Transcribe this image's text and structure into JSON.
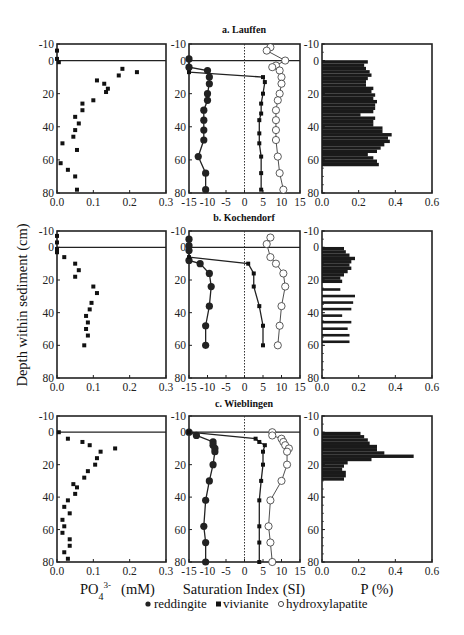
{
  "figure": {
    "y_axis_label": "Depth within sediment (cm)",
    "x_axis_labels": {
      "left": "PO",
      "left_sub": "4",
      "left_sup": "3-",
      "left_unit": "(mM)",
      "middle": "Saturation Index (SI)",
      "right": "P (%)"
    },
    "legend": [
      {
        "marker": "filled-circle",
        "label": "reddingite"
      },
      {
        "marker": "filled-square",
        "label": "vivianite"
      },
      {
        "marker": "open-circle",
        "label": "hydroxylapatite"
      }
    ],
    "panels": [
      {
        "id": "a",
        "title": "a. Lauffen"
      },
      {
        "id": "b",
        "title": "b. Kochendorf"
      },
      {
        "id": "c",
        "title": "c. Wieblingen"
      }
    ],
    "ticks": {
      "y": [
        "-10",
        "0",
        "20",
        "40",
        "60",
        "80"
      ],
      "left_x": [
        "0.0",
        "0.1",
        "0.2",
        "0.3"
      ],
      "middle_x": [
        "-15",
        "-10",
        "-5",
        "0",
        "5",
        "10",
        "15"
      ],
      "right_x": [
        "0.0",
        "0.2",
        "0.4",
        "0.6"
      ]
    }
  },
  "chart_data": [
    {
      "panel": "a. Lauffen",
      "type": "scatter",
      "title": "a. Lauffen",
      "xlabel": "PO4 3- (mM)",
      "ylabel": "Depth within sediment (cm)",
      "xlim": [
        0.0,
        0.3
      ],
      "ylim": [
        80,
        -10
      ],
      "series": [
        {
          "name": "PO4",
          "points": [
            [
              0.0,
              -6
            ],
            [
              0.0,
              -1
            ],
            [
              0.005,
              1
            ],
            [
              0.18,
              5
            ],
            [
              0.22,
              7
            ],
            [
              0.17,
              9
            ],
            [
              0.11,
              12
            ],
            [
              0.13,
              14
            ],
            [
              0.14,
              17
            ],
            [
              0.135,
              19
            ],
            [
              0.1,
              24
            ],
            [
              0.07,
              26
            ],
            [
              0.07,
              30
            ],
            [
              0.05,
              34
            ],
            [
              0.06,
              38
            ],
            [
              0.05,
              42
            ],
            [
              0.045,
              46
            ],
            [
              0.015,
              50
            ],
            [
              0.055,
              54
            ],
            [
              0.01,
              62
            ],
            [
              0.03,
              66
            ],
            [
              0.05,
              70
            ],
            [
              0.055,
              78
            ]
          ]
        }
      ]
    },
    {
      "panel": "a. Lauffen",
      "type": "line",
      "xlabel": "Saturation Index (SI)",
      "xlim": [
        -15,
        15
      ],
      "ylim": [
        80,
        -10
      ],
      "series": [
        {
          "name": "reddingite",
          "points": [
            [
              -15,
              -1
            ],
            [
              -15,
              4
            ],
            [
              -10,
              6
            ],
            [
              -9.5,
              10
            ],
            [
              -9.5,
              14
            ],
            [
              -10,
              20
            ],
            [
              -10,
              24
            ],
            [
              -11,
              30
            ],
            [
              -11,
              36
            ],
            [
              -11,
              42
            ],
            [
              -11,
              48
            ],
            [
              -12.5,
              58
            ],
            [
              -10.5,
              68
            ],
            [
              -10.5,
              78
            ]
          ]
        },
        {
          "name": "vivianite",
          "points": [
            [
              -15,
              7
            ],
            [
              5,
              10
            ],
            [
              5.5,
              13
            ],
            [
              5,
              20
            ],
            [
              4.5,
              26
            ],
            [
              4.5,
              32
            ],
            [
              4,
              36
            ],
            [
              4,
              44
            ],
            [
              4,
              50
            ],
            [
              4.5,
              58
            ],
            [
              4.5,
              68
            ],
            [
              4.5,
              78
            ]
          ]
        },
        {
          "name": "hydroxylapatite",
          "points": [
            [
              7,
              -8
            ],
            [
              6,
              -6
            ],
            [
              11,
              0
            ],
            [
              8.5,
              3
            ],
            [
              7.5,
              4
            ],
            [
              9.5,
              6
            ],
            [
              10,
              10
            ],
            [
              10,
              14
            ],
            [
              9.5,
              20
            ],
            [
              9,
              24
            ],
            [
              8.5,
              30
            ],
            [
              8.5,
              36
            ],
            [
              8.5,
              42
            ],
            [
              8.5,
              48
            ],
            [
              9,
              58
            ],
            [
              9.5,
              68
            ],
            [
              10.5,
              78
            ]
          ]
        }
      ]
    },
    {
      "panel": "a. Lauffen",
      "type": "bar",
      "orientation": "horizontal",
      "xlabel": "P (%)",
      "xlim": [
        0.0,
        0.6
      ],
      "ylim": [
        80,
        -10
      ],
      "depths": [
        1,
        3,
        5,
        7,
        9,
        11,
        13,
        15,
        17,
        19,
        21,
        23,
        25,
        27,
        29,
        31,
        33,
        35,
        37,
        39,
        41,
        43,
        45,
        47,
        49,
        51,
        53,
        55,
        57,
        59,
        61,
        63
      ],
      "values": [
        0.25,
        0.23,
        0.24,
        0.26,
        0.27,
        0.25,
        0.24,
        0.24,
        0.28,
        0.27,
        0.29,
        0.28,
        0.3,
        0.29,
        0.29,
        0.28,
        0.21,
        0.29,
        0.28,
        0.28,
        0.33,
        0.33,
        0.38,
        0.36,
        0.37,
        0.34,
        0.32,
        0.3,
        0.25,
        0.28,
        0.3,
        0.31
      ]
    },
    {
      "panel": "b. Kochendorf",
      "type": "scatter",
      "title": "b. Kochendorf",
      "xlabel": "PO4 3- (mM)",
      "xlim": [
        0.0,
        0.3
      ],
      "ylim": [
        80,
        -10
      ],
      "series": [
        {
          "name": "PO4",
          "points": [
            [
              0.0,
              -7
            ],
            [
              0.0,
              -3
            ],
            [
              0.0,
              1
            ],
            [
              0.0,
              3
            ],
            [
              0.02,
              6
            ],
            [
              0.05,
              10
            ],
            [
              0.06,
              14
            ],
            [
              0.05,
              18
            ],
            [
              0.1,
              24
            ],
            [
              0.11,
              28
            ],
            [
              0.095,
              34
            ],
            [
              0.09,
              38
            ],
            [
              0.08,
              42
            ],
            [
              0.085,
              46
            ],
            [
              0.08,
              50
            ],
            [
              0.085,
              54
            ],
            [
              0.075,
              60
            ]
          ]
        }
      ]
    },
    {
      "panel": "b. Kochendorf",
      "type": "line",
      "xlabel": "Saturation Index (SI)",
      "xlim": [
        -15,
        15
      ],
      "ylim": [
        80,
        -10
      ],
      "series": [
        {
          "name": "reddingite",
          "points": [
            [
              -15,
              -5
            ],
            [
              -15,
              -1
            ],
            [
              -15,
              2
            ],
            [
              -15,
              8
            ],
            [
              -12,
              10
            ],
            [
              -9.5,
              16
            ],
            [
              -9,
              24
            ],
            [
              -9.5,
              36
            ],
            [
              -10.5,
              48
            ],
            [
              -10.5,
              60
            ]
          ]
        },
        {
          "name": "vivianite",
          "points": [
            [
              -15,
              6
            ],
            [
              1,
              10
            ],
            [
              2.5,
              16
            ],
            [
              2.5,
              24
            ],
            [
              4,
              36
            ],
            [
              5,
              48
            ],
            [
              5,
              60
            ]
          ]
        },
        {
          "name": "hydroxylapatite",
          "points": [
            [
              7,
              -6
            ],
            [
              6,
              -2
            ],
            [
              7,
              6
            ],
            [
              8.5,
              10
            ],
            [
              10.5,
              16
            ],
            [
              11,
              24
            ],
            [
              10,
              36
            ],
            [
              9.5,
              48
            ],
            [
              9,
              60
            ]
          ]
        }
      ]
    },
    {
      "panel": "b. Kochendorf",
      "type": "bar",
      "orientation": "horizontal",
      "xlabel": "P (%)",
      "xlim": [
        0.0,
        0.6
      ],
      "ylim": [
        80,
        -10
      ],
      "depths": [
        1,
        3,
        5,
        7,
        9,
        11,
        13,
        15,
        17,
        19,
        21,
        26,
        30,
        34,
        38,
        42,
        46,
        50,
        54,
        58
      ],
      "values": [
        0.12,
        0.13,
        0.15,
        0.18,
        0.16,
        0.15,
        0.16,
        0.14,
        0.12,
        0.1,
        0.11,
        0.1,
        0.18,
        0.17,
        0.16,
        0.11,
        0.16,
        0.14,
        0.15,
        0.15
      ]
    },
    {
      "panel": "c. Wieblingen",
      "type": "scatter",
      "title": "c. Wieblingen",
      "xlabel": "PO4 3- (mM)",
      "xlim": [
        0.0,
        0.3
      ],
      "ylim": [
        80,
        -10
      ],
      "series": [
        {
          "name": "PO4",
          "points": [
            [
              0.005,
              0
            ],
            [
              0.03,
              4
            ],
            [
              0.07,
              6
            ],
            [
              0.09,
              8
            ],
            [
              0.16,
              10
            ],
            [
              0.12,
              12
            ],
            [
              0.11,
              16
            ],
            [
              0.105,
              20
            ],
            [
              0.085,
              24
            ],
            [
              0.075,
              28
            ],
            [
              0.045,
              32
            ],
            [
              0.055,
              34
            ],
            [
              0.05,
              38
            ],
            [
              0.03,
              42
            ],
            [
              0.02,
              46
            ],
            [
              0.035,
              50
            ],
            [
              0.015,
              54
            ],
            [
              0.02,
              58
            ],
            [
              0.015,
              62
            ],
            [
              0.035,
              66
            ],
            [
              0.035,
              70
            ],
            [
              0.02,
              74
            ],
            [
              0.03,
              78
            ]
          ]
        }
      ]
    },
    {
      "panel": "c. Wieblingen",
      "type": "line",
      "xlabel": "Saturation Index (SI)",
      "xlim": [
        -15,
        15
      ],
      "ylim": [
        80,
        -10
      ],
      "series": [
        {
          "name": "reddingite",
          "points": [
            [
              -15,
              0
            ],
            [
              -13,
              2
            ],
            [
              -8.5,
              6
            ],
            [
              -8.5,
              8
            ],
            [
              -8,
              10
            ],
            [
              -8,
              12
            ],
            [
              -8.5,
              20
            ],
            [
              -9.5,
              30
            ],
            [
              -10.5,
              42
            ],
            [
              -11,
              58
            ],
            [
              -10.5,
              68
            ],
            [
              -10.5,
              80
            ]
          ]
        },
        {
          "name": "vivianite",
          "points": [
            [
              -15,
              0
            ],
            [
              3,
              4
            ],
            [
              4,
              6
            ],
            [
              5.5,
              8
            ],
            [
              5,
              12
            ],
            [
              5,
              20
            ],
            [
              4.5,
              30
            ],
            [
              4,
              42
            ],
            [
              4,
              58
            ],
            [
              4,
              68
            ],
            [
              4,
              80
            ]
          ]
        },
        {
          "name": "hydroxylapatite",
          "points": [
            [
              7.5,
              0
            ],
            [
              7.5,
              2
            ],
            [
              10,
              4
            ],
            [
              10.5,
              6
            ],
            [
              11,
              8
            ],
            [
              12,
              10
            ],
            [
              11.5,
              12
            ],
            [
              11.5,
              20
            ],
            [
              10,
              30
            ],
            [
              7,
              42
            ],
            [
              6.5,
              58
            ],
            [
              7,
              68
            ],
            [
              7.5,
              80
            ]
          ]
        }
      ]
    },
    {
      "panel": "c. Wieblingen",
      "type": "bar",
      "orientation": "horizontal",
      "xlabel": "P (%)",
      "xlim": [
        0.0,
        0.6
      ],
      "ylim": [
        80,
        -10
      ],
      "depths": [
        1,
        3,
        5,
        7,
        9,
        11,
        13,
        15,
        17,
        19,
        21,
        23,
        25,
        27,
        29
      ],
      "values": [
        0.21,
        0.23,
        0.25,
        0.26,
        0.3,
        0.3,
        0.34,
        0.5,
        0.27,
        0.14,
        0.12,
        0.11,
        0.13,
        0.13,
        0.12
      ]
    }
  ]
}
